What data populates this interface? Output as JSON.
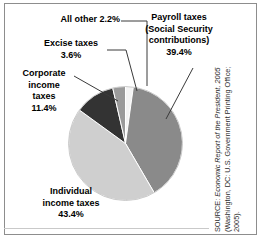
{
  "chart_data": {
    "type": "pie",
    "title": "",
    "subtitle": "",
    "xlabel": "",
    "ylabel": "",
    "legend_position": "none",
    "grid": false,
    "units": "percent",
    "categories": [
      "Payroll taxes (Social Security contributions)",
      "Individual income taxes",
      "Corporate income taxes",
      "Excise taxes",
      "All other"
    ],
    "values": [
      39.4,
      43.4,
      11.4,
      3.6,
      2.2
    ],
    "slices": [
      {
        "name": "payroll-taxes",
        "label": "Payroll taxes\n(Social Security\ncontributions)\n39.4%",
        "value": 39.4,
        "value_text": "39.4%",
        "color": "#8a8a8a"
      },
      {
        "name": "individual-income-taxes",
        "label": "Individual\nincome taxes\n43.4%",
        "value": 43.4,
        "value_text": "43.4%",
        "color": "#cfcfcf"
      },
      {
        "name": "corporate-income-taxes",
        "label": "Corporate\nincome\ntaxes\n11.4%",
        "value": 11.4,
        "value_text": "11.4%",
        "color": "#333333"
      },
      {
        "name": "excise-taxes",
        "label": "Excise taxes\n3.6%",
        "value": 3.6,
        "value_text": "3.6%",
        "color": "#9a9a9a"
      },
      {
        "name": "all-other",
        "label": "All other 2.2%",
        "value": 2.2,
        "value_text": "2.2%",
        "color": "#f4f4f4"
      }
    ]
  },
  "labels": {
    "all_other": "All other 2.2%",
    "excise": "Excise taxes\n3.6%",
    "corporate": "Corporate\nincome\ntaxes\n11.4%",
    "individual": "Individual\nincome taxes\n43.4%",
    "payroll": "Payroll taxes\n(Social Security\ncontributions)\n39.4%"
  },
  "source": {
    "line1_prefix": "SOURCE: ",
    "line1_italic": "Economic Report of the President, 2005",
    "line2": "(Washington, DC: U.S. Government Printing Office;",
    "line3": "2005)."
  },
  "colors": {
    "slice_payroll": "#8a8a8a",
    "slice_individual": "#cfcfcf",
    "slice_corporate": "#333333",
    "slice_excise": "#9a9a9a",
    "slice_all_other": "#f4f4f4",
    "leader_line": "#3a3a3a",
    "frame": "#8d8d8d",
    "text": "#000000"
  }
}
